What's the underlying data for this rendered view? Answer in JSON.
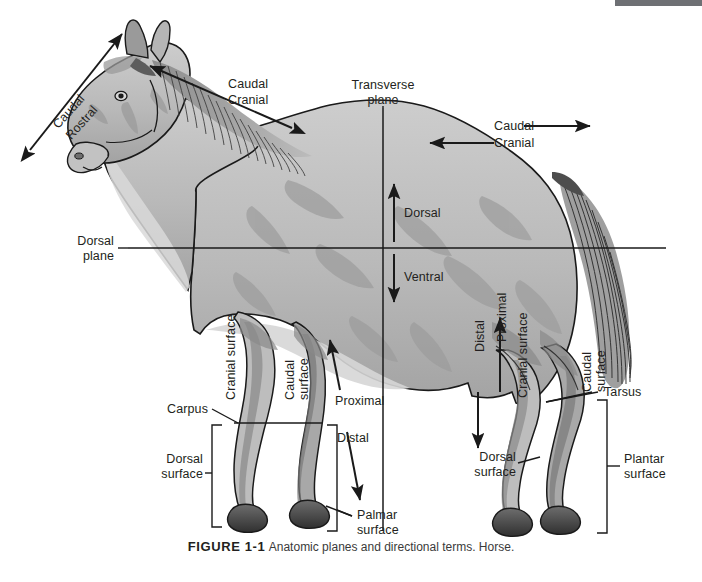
{
  "figure": {
    "caption_label": "FIGURE 1-1",
    "caption_text": "Anatomic planes and directional terms. Horse.",
    "subject": "horse",
    "line_color": "#231f20",
    "text_color": "#231f20",
    "top_bar_color": "#6e7074",
    "background": "#ffffff"
  },
  "planes": {
    "transverse": "Transverse\nplane",
    "transverse_line1": "Transverse",
    "transverse_line2": "plane",
    "dorsal": "Dorsal\nplane",
    "dorsal_line1": "Dorsal",
    "dorsal_line2": "plane"
  },
  "head_axis": {
    "caudal": "Caudal",
    "rostral": "Rostral"
  },
  "neck_axis": {
    "caudal": "Caudal",
    "cranial": "Cranial"
  },
  "trunk_axis": {
    "caudal": "Caudal",
    "cranial": "Cranial"
  },
  "body_axis": {
    "dorsal": "Dorsal",
    "ventral": "Ventral"
  },
  "forelimb": {
    "cranial_surface": "Cranial surface",
    "caudal_surface_line1": "Caudal",
    "caudal_surface_line2": "surface",
    "proximal": "Proximal",
    "distal": "Distal",
    "carpus": "Carpus",
    "dorsal_surface_line1": "Dorsal",
    "dorsal_surface_line2": "surface",
    "palmar_surface_line1": "Palmar",
    "palmar_surface_line2": "surface"
  },
  "hindlimb": {
    "distal": "Distal",
    "proximal": "Proximal",
    "cranial_surface": "Cranial surface",
    "caudal_surface_line1": "Caudal",
    "caudal_surface_line2": "surface",
    "tarsus": "Tarsus",
    "dorsal_surface_line1": "Dorsal",
    "dorsal_surface_line2": "surface",
    "plantar_surface_line1": "Plantar",
    "plantar_surface_line2": "surface"
  },
  "colors": {
    "body_light": "#c9c9c9",
    "body_mid": "#a8a8a8",
    "body_dark": "#858585",
    "body_darker": "#6b6b6b",
    "hoof": "#4a4a4a",
    "outline": "#1a1a1a",
    "white_marking": "#f2f2f2"
  }
}
